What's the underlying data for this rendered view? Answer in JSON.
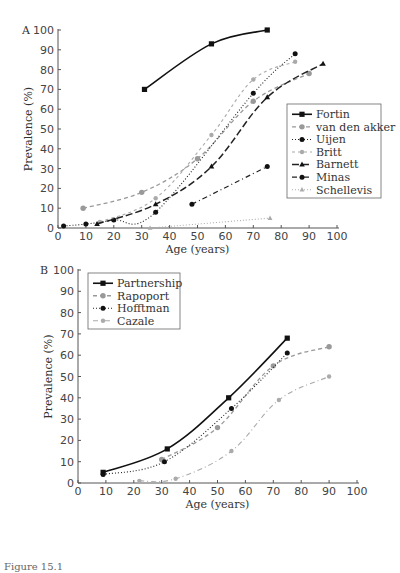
{
  "chart_data": [
    {
      "type": "line",
      "panel": "A",
      "xlabel": "Age (years)",
      "ylabel": "Prevalence (%)",
      "xlim": [
        0,
        100
      ],
      "ylim": [
        0,
        100
      ],
      "xticks": [
        0,
        10,
        20,
        30,
        40,
        50,
        60,
        70,
        80,
        90,
        100
      ],
      "yticks": [
        0,
        10,
        20,
        30,
        40,
        50,
        60,
        70,
        80,
        90,
        100
      ],
      "legend_position": "right-middle",
      "series": [
        {
          "name": "Fortin",
          "color": "#111111",
          "dash": "",
          "width": 1.6,
          "marker": "square",
          "x": [
            31,
            55,
            75
          ],
          "y": [
            70,
            93,
            100
          ]
        },
        {
          "name": "van den akker",
          "color": "#999999",
          "dash": "4,3",
          "width": 1.3,
          "marker": "circle-gray",
          "x": [
            9,
            30,
            50,
            70,
            90
          ],
          "y": [
            10,
            18,
            35,
            64,
            78
          ]
        },
        {
          "name": "Uijen",
          "color": "#222222",
          "dash": "1,2",
          "width": 1.1,
          "marker": "circle",
          "x": [
            2,
            10,
            20,
            35,
            70,
            85
          ],
          "y": [
            1,
            2,
            4,
            8,
            68,
            88
          ]
        },
        {
          "name": "Britt",
          "color": "#aaaaaa",
          "dash": "3,3",
          "width": 1.1,
          "marker": "circle-gray-small",
          "x": [
            15,
            35,
            55,
            70,
            85
          ],
          "y": [
            3,
            15,
            47,
            75,
            84
          ]
        },
        {
          "name": "Barnett",
          "color": "#222222",
          "dash": "7,3",
          "width": 1.5,
          "marker": "triangle",
          "x": [
            14,
            35,
            55,
            75,
            95
          ],
          "y": [
            2,
            12,
            31,
            66,
            83
          ]
        },
        {
          "name": "Minas",
          "color": "#222222",
          "dash": "5,3,1,3",
          "width": 1.2,
          "marker": "circle",
          "x": [
            48,
            75
          ],
          "y": [
            12,
            31
          ]
        },
        {
          "name": "Schellevis",
          "color": "#aaaaaa",
          "dash": "1,2",
          "width": 1.1,
          "marker": "triangle-gray",
          "x": [
            33,
            76
          ],
          "y": [
            0,
            5
          ]
        }
      ]
    },
    {
      "type": "line",
      "panel": "B",
      "xlabel": "Age (years)",
      "ylabel": "Prevalence (%)",
      "xlim": [
        0,
        100
      ],
      "ylim": [
        0,
        100
      ],
      "xticks": [
        0,
        10,
        20,
        30,
        40,
        50,
        60,
        70,
        80,
        90,
        100
      ],
      "yticks": [
        0,
        10,
        20,
        30,
        40,
        50,
        60,
        70,
        80,
        90,
        100
      ],
      "legend_position": "upper-left",
      "series": [
        {
          "name": "Partnership",
          "color": "#111111",
          "dash": "",
          "width": 1.6,
          "marker": "square",
          "x": [
            9,
            32,
            54,
            75
          ],
          "y": [
            5,
            16,
            40,
            68
          ]
        },
        {
          "name": "Rapoport",
          "color": "#999999",
          "dash": "4,3",
          "width": 1.3,
          "marker": "circle-gray",
          "x": [
            30,
            50,
            70,
            90
          ],
          "y": [
            11,
            26,
            55,
            64
          ]
        },
        {
          "name": "Hofftman",
          "color": "#222222",
          "dash": "1,2",
          "width": 1.1,
          "marker": "circle",
          "x": [
            9,
            31,
            55,
            75
          ],
          "y": [
            4,
            10,
            35,
            61
          ]
        },
        {
          "name": "Cazale",
          "color": "#aaaaaa",
          "dash": "5,3,1,3",
          "width": 1.1,
          "marker": "circle-gray-small",
          "x": [
            22,
            35,
            55,
            72,
            90
          ],
          "y": [
            1,
            2,
            15,
            39,
            50
          ]
        }
      ]
    }
  ],
  "panels": {
    "a_label": "A",
    "b_label": "B"
  },
  "caption": "Figure 15.1"
}
